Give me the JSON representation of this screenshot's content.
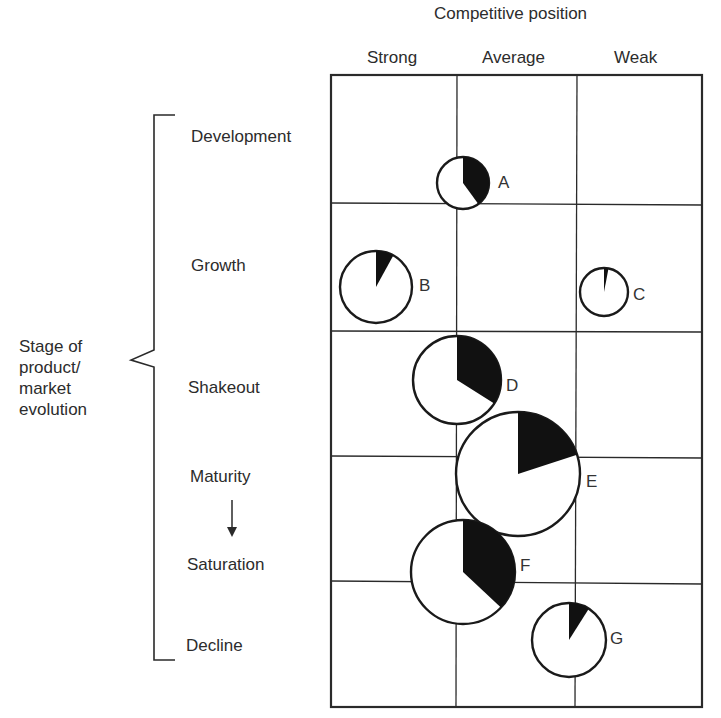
{
  "title": "Competitive position",
  "columns": [
    "Strong",
    "Average",
    "Weak"
  ],
  "y_axis_label_lines": [
    "Stage of",
    "product/",
    "market",
    "evolution"
  ],
  "rows": [
    "Development",
    "Growth",
    "Shakeout",
    "Maturity",
    "Saturation",
    "Decline"
  ],
  "chart_data": {
    "type": "bubble-pie-matrix",
    "title": "Competitive position",
    "x_axis": {
      "label": "Competitive position",
      "categories": [
        "Strong",
        "Average",
        "Weak"
      ]
    },
    "y_axis": {
      "label": "Stage of product/market evolution",
      "categories": [
        "Development",
        "Growth",
        "Shakeout",
        "Maturity",
        "Saturation",
        "Decline"
      ],
      "note": "Maturity arrow to Saturation"
    },
    "bubbles": [
      {
        "label": "A",
        "stage": "Development",
        "position": "Strong/Average boundary",
        "relative_size": 26,
        "filled_share_pct": 40
      },
      {
        "label": "B",
        "stage": "Growth",
        "position": "Strong",
        "relative_size": 36,
        "filled_share_pct": 8
      },
      {
        "label": "C",
        "stage": "Growth",
        "position": "Weak",
        "relative_size": 24,
        "filled_share_pct": 3
      },
      {
        "label": "D",
        "stage": "Shakeout",
        "position": "Strong/Average boundary",
        "relative_size": 44,
        "filled_share_pct": 34
      },
      {
        "label": "E",
        "stage": "Maturity",
        "position": "Average",
        "relative_size": 62,
        "filled_share_pct": 20
      },
      {
        "label": "F",
        "stage": "Saturation",
        "position": "Strong/Average boundary",
        "relative_size": 52,
        "filled_share_pct": 37
      },
      {
        "label": "G",
        "stage": "Decline",
        "position": "Average/Weak boundary",
        "relative_size": 37,
        "filled_share_pct": 9
      }
    ],
    "grid": true,
    "legend": null
  },
  "bubble_labels": {
    "A": "A",
    "B": "B",
    "C": "C",
    "D": "D",
    "E": "E",
    "F": "F",
    "G": "G"
  }
}
